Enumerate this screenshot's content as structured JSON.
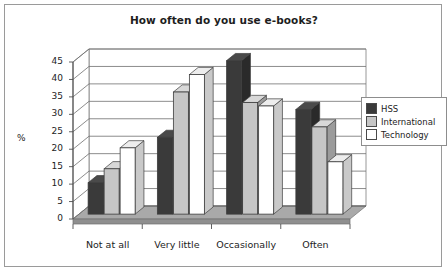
{
  "chart_data": {
    "type": "bar",
    "title": "How often do you use e-books?",
    "xlabel": "",
    "ylabel": "%",
    "ylim": [
      0,
      45
    ],
    "yticks": [
      0,
      5,
      10,
      15,
      20,
      25,
      30,
      35,
      40,
      45
    ],
    "grid": true,
    "legend_position": "right",
    "style": "3d-column",
    "categories": [
      "Not at all",
      "Very little",
      "Occasionally",
      "Often"
    ],
    "series": [
      {
        "name": "HSS",
        "color": "#3a3a3a",
        "values": [
          9,
          22,
          44,
          30
        ]
      },
      {
        "name": "International",
        "color": "#c6c6c6",
        "values": [
          13,
          35,
          32,
          25
        ]
      },
      {
        "name": "Technology",
        "color": "#ffffff",
        "values": [
          19,
          40,
          31,
          15
        ]
      }
    ]
  },
  "colors": {
    "frame_border": "#9a9a9a",
    "axis_line": "#4f4f4f",
    "grid_line": "#6f6f6f",
    "floor": "#a9a9a9",
    "floor_side": "#8f8f8f",
    "bar_side_dark": "#2a2a2a",
    "bar_side_gray": "#9b9b9b",
    "bar_side_white": "#c9c9c9",
    "bar_top_dark": "#4a4a4a",
    "bar_top_gray": "#d8d8d8",
    "bar_top_white": "#ededed",
    "text": "#1d1d1d"
  }
}
